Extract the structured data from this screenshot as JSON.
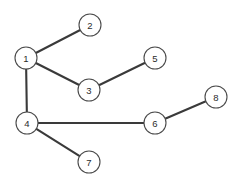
{
  "diagram": {
    "background_color": "#ffffff",
    "node_fill_color": "#ffffff",
    "node_stroke_color": "#4a4a4a",
    "edge_color": "#3a3a3a",
    "label_color": "#2b2b2b",
    "node_radius": 11,
    "edge_width": 2.1,
    "nodes": [
      {
        "id": "1",
        "label": "1",
        "x": 26,
        "y": 58
      },
      {
        "id": "2",
        "label": "2",
        "x": 90,
        "y": 25
      },
      {
        "id": "3",
        "label": "3",
        "x": 89,
        "y": 90
      },
      {
        "id": "4",
        "label": "4",
        "x": 27,
        "y": 123
      },
      {
        "id": "5",
        "label": "5",
        "x": 155,
        "y": 58
      },
      {
        "id": "6",
        "label": "6",
        "x": 155,
        "y": 123
      },
      {
        "id": "7",
        "label": "7",
        "x": 89,
        "y": 162
      },
      {
        "id": "8",
        "label": "8",
        "x": 216,
        "y": 97
      }
    ],
    "edges": [
      {
        "id": "e1",
        "source": "1",
        "target": "2"
      },
      {
        "id": "e2",
        "source": "1",
        "target": "3"
      },
      {
        "id": "e3",
        "source": "1",
        "target": "4"
      },
      {
        "id": "e4",
        "source": "3",
        "target": "5"
      },
      {
        "id": "e5",
        "source": "4",
        "target": "6"
      },
      {
        "id": "e6",
        "source": "4",
        "target": "7"
      },
      {
        "id": "e7",
        "source": "6",
        "target": "8"
      }
    ]
  }
}
